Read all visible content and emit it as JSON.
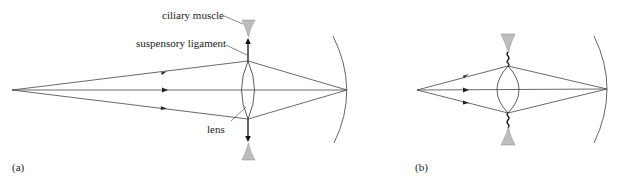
{
  "figure": {
    "panels": [
      {
        "id": "a",
        "label": "(a)",
        "description": "Eye relaxed: ciliary muscle relaxed, suspensory ligaments taut, lens thin",
        "annotations": {
          "ciliary_muscle": "ciliary muscle",
          "suspensory_ligament": "suspensory ligament",
          "lens": "lens"
        }
      },
      {
        "id": "b",
        "label": "(b)",
        "description": "Eye accommodating: ciliary muscle contracted, suspensory ligaments slack, lens thick"
      }
    ],
    "colors": {
      "muscle_fill": "#bdbdbd",
      "ray": "#444444",
      "retina": "#555555"
    }
  }
}
